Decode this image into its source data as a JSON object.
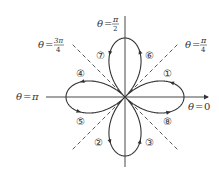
{
  "figure": {
    "curve": "four-leaved rose r = cos 2θ",
    "colors": {
      "curve": "#333333",
      "axis": "#333333",
      "dashed": "#444444",
      "background": "#ffffff"
    },
    "angle_labels": {
      "theta_0": {
        "var": "θ",
        "eq": "=",
        "value": "0"
      },
      "theta_pi_4": {
        "var": "θ",
        "eq": "=",
        "num": "π",
        "den": "4"
      },
      "theta_pi_2": {
        "var": "θ",
        "eq": "=",
        "num": "π",
        "den": "2"
      },
      "theta_3pi_4": {
        "var": "θ",
        "eq": "=",
        "num": "3π",
        "den": "4"
      },
      "theta_pi": {
        "var": "θ",
        "eq": "=",
        "value": "π"
      }
    },
    "loop_labels": [
      "①",
      "②",
      "③",
      "④",
      "⑤",
      "⑥",
      "⑦",
      "⑧"
    ]
  }
}
